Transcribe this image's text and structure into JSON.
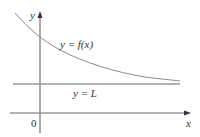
{
  "diagram": {
    "axes": {
      "x_label": "x",
      "y_label": "y",
      "origin_label": "0"
    },
    "curve": {
      "label": "y = f(x)",
      "description": "decreasing curve approaching horizontal asymptote"
    },
    "asymptote": {
      "label": "y = L"
    },
    "colors": {
      "axis": "#555555",
      "curve": "#8a8a8a",
      "asymptote": "#999999",
      "text": "#333333"
    }
  }
}
